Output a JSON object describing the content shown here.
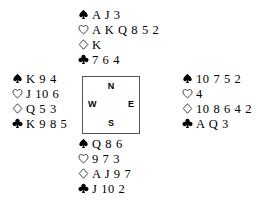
{
  "diagram": {
    "type": "bridge-hand-diagram",
    "suit_order": [
      "spades",
      "hearts",
      "diamonds",
      "clubs"
    ],
    "suit_symbols": {
      "spades": "spade-icon",
      "hearts": "heart-icon",
      "diamonds": "diamond-icon",
      "clubs": "club-icon"
    },
    "compass": {
      "north": "N",
      "south": "S",
      "east": "E",
      "west": "W"
    },
    "hands": {
      "north": {
        "label": "North",
        "spades": "A J 3",
        "hearts": "A K Q 8 5 2",
        "diamonds": "K",
        "clubs": "7 6 4"
      },
      "west": {
        "label": "West",
        "spades": "K 9 4",
        "hearts": "J 10 6",
        "diamonds": "Q 5 3",
        "clubs": "K 9 8 5"
      },
      "east": {
        "label": "East",
        "spades": "10 7 5 2",
        "hearts": "4",
        "diamonds": "10 8 6 4 2",
        "clubs": "A Q 3"
      },
      "south": {
        "label": "South",
        "spades": "Q 8 6",
        "hearts": "9 7 3",
        "diamonds": "A J 9 7",
        "clubs": "J 10 2"
      }
    },
    "colors": {
      "ink": "#000000",
      "background": "#ffffff",
      "box_border": "#555555"
    }
  }
}
